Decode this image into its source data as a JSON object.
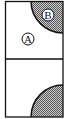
{
  "diagram": {
    "labels": {
      "region_a": "A",
      "region_b": "B"
    },
    "colors": {
      "stroke": "#111111",
      "shade": "#777777",
      "background": "#ffffff"
    }
  }
}
